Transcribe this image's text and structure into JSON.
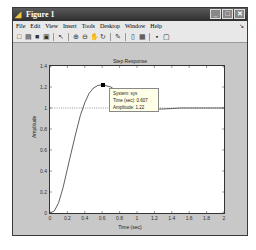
{
  "window": {
    "title": "Figure 1",
    "controls": [
      "minimize",
      "maximize",
      "close"
    ]
  },
  "menubar": {
    "items": [
      "File",
      "Edit",
      "View",
      "Insert",
      "Tools",
      "Desktop",
      "Window",
      "Help"
    ]
  },
  "toolbar": {
    "buttons": [
      {
        "name": "new-figure-icon",
        "glyph": "□"
      },
      {
        "name": "open-file-icon",
        "glyph": "▤"
      },
      {
        "name": "save-icon",
        "glyph": "■"
      },
      {
        "name": "print-icon",
        "glyph": "▣"
      },
      {
        "name": "edit-plot-icon",
        "glyph": "↖"
      },
      {
        "name": "zoom-in-icon",
        "glyph": "⊕"
      },
      {
        "name": "zoom-out-icon",
        "glyph": "⊖"
      },
      {
        "name": "pan-icon",
        "glyph": "✋"
      },
      {
        "name": "rotate-icon",
        "glyph": "↻"
      },
      {
        "name": "data-cursor-icon",
        "glyph": "✎"
      },
      {
        "name": "colorbar-icon",
        "glyph": "▯"
      },
      {
        "name": "legend-icon",
        "glyph": "▦"
      },
      {
        "name": "hide-plot-tools-icon",
        "glyph": "▪"
      },
      {
        "name": "show-plot-tools-icon",
        "glyph": "▢"
      }
    ]
  },
  "chart_data": {
    "type": "line",
    "title": "Step Response",
    "xlabel": "Time (sec)",
    "ylabel": "Amplitude",
    "xlim": [
      0,
      2
    ],
    "ylim": [
      0,
      1.4
    ],
    "xticks": [
      "0",
      "0.2",
      "0.4",
      "0.6",
      "0.8",
      "1",
      "1.2",
      "1.4",
      "1.6",
      "1.8",
      "2"
    ],
    "yticks": [
      "0",
      "0.2",
      "0.4",
      "0.6",
      "0.8",
      "1",
      "1.2",
      "1.4"
    ],
    "grid": false,
    "reference_line": {
      "y": 1,
      "style": "dotted"
    },
    "series": [
      {
        "name": "sys",
        "x": [
          0,
          0.05,
          0.1,
          0.15,
          0.2,
          0.25,
          0.3,
          0.35,
          0.4,
          0.45,
          0.5,
          0.55,
          0.607,
          0.7,
          0.8,
          0.9,
          1.0,
          1.1,
          1.2,
          1.3,
          1.4,
          1.5,
          1.6,
          1.8,
          2.0
        ],
        "y": [
          0,
          0.02,
          0.1,
          0.24,
          0.42,
          0.6,
          0.77,
          0.93,
          1.05,
          1.14,
          1.19,
          1.215,
          1.22,
          1.2,
          1.14,
          1.08,
          1.03,
          1.0,
          0.99,
          0.99,
          0.995,
          1.0,
          1.0,
          1.0,
          1.0
        ]
      }
    ],
    "datatip": {
      "system": "System: sys",
      "time": "Time (sec): 0.607",
      "amplitude": "Amplitude: 1.22"
    }
  }
}
